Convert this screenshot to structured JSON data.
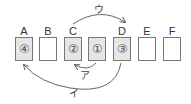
{
  "diagram": {
    "slots": [
      {
        "label": "A",
        "content": "④",
        "filled": true
      },
      {
        "label": "B",
        "content": "",
        "filled": false
      },
      {
        "label": "C",
        "content": "②",
        "filled": true
      },
      {
        "label": "",
        "content": "①",
        "filled": true
      },
      {
        "label": "D",
        "content": "③",
        "filled": true
      },
      {
        "label": "E",
        "content": "",
        "filled": false
      },
      {
        "label": "F",
        "content": "",
        "filled": false
      }
    ],
    "arrows": [
      {
        "label": "ア",
        "from": "①",
        "to": "C"
      },
      {
        "label": "イ",
        "from": "D",
        "to": "A"
      },
      {
        "label": "ウ",
        "from": "C",
        "to": "D"
      }
    ],
    "colors": {
      "filled": "#e6e6e6",
      "border": "#777777",
      "arrow": "#666666"
    }
  }
}
